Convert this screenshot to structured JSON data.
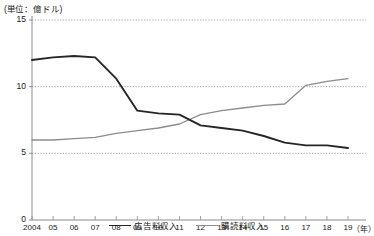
{
  "unit_note": "(単位：億ドル)",
  "axis": {
    "y_ticks": [
      "0",
      "5",
      "10",
      "15"
    ],
    "x_unit_label": "（年）",
    "x_ticks": [
      "2004",
      "05",
      "06",
      "07",
      "08",
      "09",
      "10",
      "11",
      "12",
      "13",
      "14",
      "15",
      "16",
      "17",
      "18",
      "19"
    ]
  },
  "legend": {
    "items": [
      {
        "label": "広告料収入",
        "color": "#262626"
      },
      {
        "label": "購読料収入",
        "color": "#8c8c8c"
      }
    ]
  },
  "chart_data": {
    "type": "line",
    "title": "",
    "xlabel": "（年）",
    "ylabel": "(単位：億ドル)",
    "categories": [
      "2004",
      "05",
      "06",
      "07",
      "08",
      "09",
      "10",
      "11",
      "12",
      "13",
      "14",
      "15",
      "16",
      "17",
      "18",
      "19"
    ],
    "x_values": [
      2004,
      2005,
      2006,
      2007,
      2008,
      2009,
      2010,
      2011,
      2012,
      2013,
      2014,
      2015,
      2016,
      2017,
      2018,
      2019
    ],
    "ylim": [
      0,
      15
    ],
    "y_ticks": [
      0,
      5,
      10,
      15
    ],
    "grid": "horizontal-dotted",
    "legend_position": "bottom-center",
    "series": [
      {
        "name": "広告料収入",
        "color": "#262626",
        "values": [
          12.0,
          12.2,
          12.3,
          12.2,
          10.6,
          8.2,
          8.0,
          7.9,
          7.1,
          6.9,
          6.7,
          6.3,
          5.8,
          5.6,
          5.6,
          5.4
        ]
      },
      {
        "name": "購読料収入",
        "color": "#8c8c8c",
        "values": [
          6.0,
          6.0,
          6.1,
          6.2,
          6.5,
          6.7,
          6.9,
          7.2,
          7.9,
          8.2,
          8.4,
          8.6,
          8.7,
          10.1,
          10.4,
          10.6
        ]
      }
    ]
  }
}
